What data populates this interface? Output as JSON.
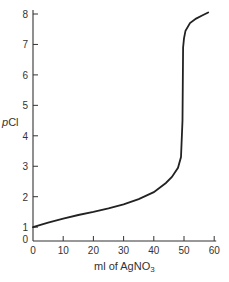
{
  "chart_data": {
    "type": "line",
    "title": "",
    "xlabel": "ml of AgNO3",
    "ylabel": "pCl",
    "xlim": [
      0,
      60
    ],
    "ylim": [
      0,
      8
    ],
    "grid": false,
    "legend": null,
    "x_ticks": [
      0,
      10,
      20,
      30,
      40,
      50,
      60
    ],
    "y_ticks": [
      0,
      1,
      2,
      3,
      4,
      5,
      6,
      7,
      8
    ],
    "series": [
      {
        "name": "titration curve",
        "x": [
          0,
          5,
          10,
          15,
          20,
          25,
          30,
          35,
          40,
          44,
          46,
          48,
          49,
          49.5,
          49.7,
          50,
          50.5,
          52,
          54,
          56,
          58
        ],
        "y": [
          1.0,
          1.15,
          1.28,
          1.4,
          1.5,
          1.62,
          1.75,
          1.92,
          2.15,
          2.45,
          2.65,
          2.95,
          3.3,
          4.5,
          6.9,
          7.2,
          7.45,
          7.7,
          7.85,
          7.95,
          8.05
        ]
      }
    ]
  },
  "labels": {
    "xlabel_main": "ml of AgNO",
    "xlabel_sub": "3",
    "ylabel_p": "p",
    "ylabel_cl": "Cl"
  }
}
